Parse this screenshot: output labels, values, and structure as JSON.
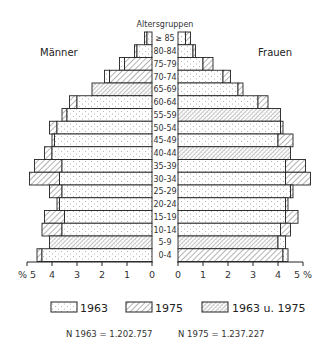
{
  "chart_data": {
    "type": "bar",
    "subtype": "population-pyramid",
    "title": "",
    "category_header": "Altersgruppen",
    "left_label": "Männer",
    "right_label": "Frauen",
    "xlabel": "%",
    "xlim": [
      0,
      5
    ],
    "x_ticks": [
      "0",
      "1",
      "2",
      "3",
      "4",
      "5"
    ],
    "left_axis_ticks_text": [
      "% 5",
      "4",
      "3",
      "2",
      "1",
      "0"
    ],
    "right_axis_ticks_text": [
      "0",
      "1",
      "2",
      "3",
      "4",
      "5 %"
    ],
    "categories": [
      "≥ 85",
      "80-84",
      "75-79",
      "70-74",
      "65-69",
      "60-64",
      "55-59",
      "50-54",
      "45-49",
      "40-44",
      "35-39",
      "30-34",
      "25-29",
      "20-24",
      "15-19",
      "10-14",
      "5-9",
      "0-4"
    ],
    "series": [
      {
        "name": "Männer 1963",
        "values": [
          0.2,
          0.6,
          1.3,
          1.9,
          2.4,
          3.0,
          3.4,
          3.8,
          3.9,
          4.0,
          3.6,
          3.7,
          3.6,
          3.7,
          3.5,
          3.6,
          4.1,
          4.4
        ]
      },
      {
        "name": "Männer 1975",
        "values": [
          0.3,
          0.7,
          1.1,
          1.7,
          2.4,
          3.3,
          3.6,
          4.1,
          4.0,
          4.3,
          4.7,
          4.9,
          4.1,
          3.8,
          4.3,
          4.4,
          4.1,
          4.6
        ]
      },
      {
        "name": "Frauen 1963",
        "values": [
          0.3,
          0.6,
          1.0,
          1.8,
          2.4,
          3.2,
          4.1,
          4.1,
          4.0,
          4.5,
          4.3,
          4.3,
          4.5,
          4.3,
          4.3,
          4.1,
          4.3,
          4.4
        ]
      },
      {
        "name": "Frauen 1975",
        "values": [
          0.5,
          0.7,
          1.4,
          2.1,
          2.6,
          3.6,
          4.1,
          4.2,
          4.6,
          4.5,
          5.1,
          5.3,
          4.6,
          4.4,
          4.8,
          4.5,
          4.0,
          4.2
        ]
      }
    ],
    "legend": [
      {
        "label": "1963",
        "pattern": "dots"
      },
      {
        "label": "1975",
        "pattern": "hatch"
      },
      {
        "label": "1963 u. 1975",
        "pattern": "dense-hatch"
      }
    ],
    "legend_position": "bottom",
    "grid": false,
    "annotations": [
      "N 1963 = 1.202.757",
      "N 1975 = 1.237.227"
    ]
  },
  "texts": {
    "header": "Altersgruppen",
    "men": "Männer",
    "women": "Frauen",
    "legend1": "1963",
    "legend2": "1975",
    "legend3": "1963 u. 1975",
    "n1963": "N 1963 = 1.202.757",
    "n1975": "N 1975 = 1.237.227"
  }
}
